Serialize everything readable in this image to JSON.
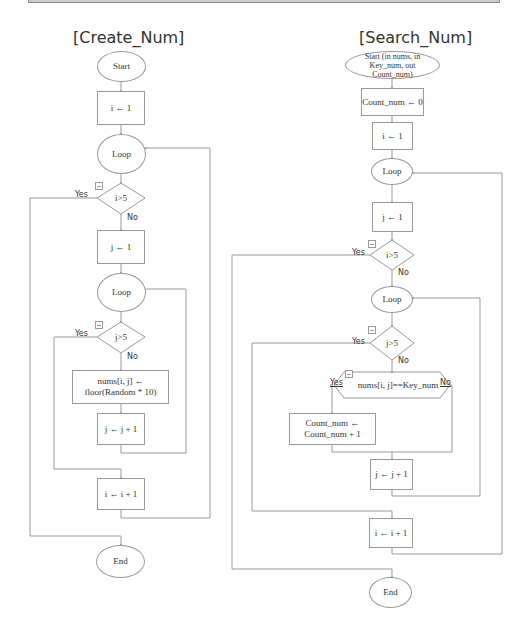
{
  "diagrams": {
    "create_num": {
      "title": "[Create_Num]",
      "start": "Start",
      "init_i": "i ← 1",
      "loop_outer": "Loop",
      "cond_i": "i>5",
      "init_j": "j ← 1",
      "loop_inner": "Loop",
      "cond_j": "j>5",
      "assign": "nums[i, j] ← floor(Random * 10)",
      "inc_j": "j ← j + 1",
      "inc_i": "i ← i + 1",
      "end": "End",
      "yes_label": "Yes",
      "no_label": "No"
    },
    "search_num": {
      "title": "[Search_Num]",
      "start": "Start (in nums, in Key_num, out Count_num)",
      "init_count": "Count_num ← 0",
      "init_i": "i ← 1",
      "loop_outer": "Loop",
      "init_j": "j ← 1",
      "cond_i": "i>5",
      "loop_inner": "Loop",
      "cond_j": "j>5",
      "cond_key": "nums[i, j]==Key_num",
      "inc_count": "Count_num ← Count_num + 1",
      "inc_j": "j ← j + 1",
      "inc_i": "i ← i + 1",
      "end": "End",
      "yes_label": "Yes",
      "no_label": "No"
    }
  },
  "colors": {
    "line": "#999999",
    "text": "#333333"
  }
}
